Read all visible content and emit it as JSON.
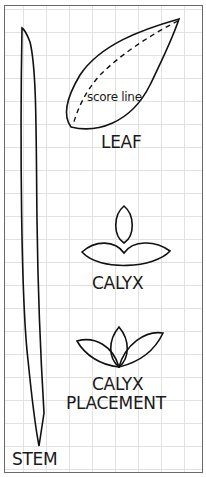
{
  "diagram": {
    "labels": {
      "score_line": "score line",
      "leaf": "LEAF",
      "calyx": "CALYX",
      "calyx_placement_line1": "CALYX",
      "calyx_placement_line2": "PLACEMENT",
      "stem": "STEM"
    },
    "colors": {
      "line": "#111111",
      "grid": "#e2e2e2",
      "border": "#6a6a6a"
    }
  }
}
